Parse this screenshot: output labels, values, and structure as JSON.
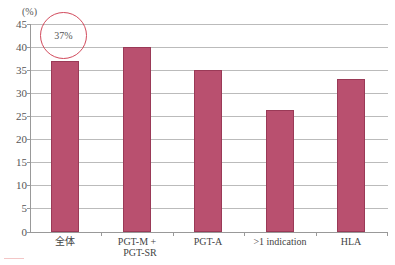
{
  "chart_data": {
    "type": "bar",
    "title": "",
    "xlabel": "",
    "ylabel": "(%)",
    "ylim": [
      0,
      45
    ],
    "yticks": [
      0,
      5,
      10,
      15,
      20,
      25,
      30,
      35,
      40,
      45
    ],
    "grid": true,
    "legend": null,
    "categories": [
      "全体",
      "PGT-M + PGT-SR",
      "PGT-A",
      ">1 indication",
      "HLA"
    ],
    "values": [
      37,
      40,
      35,
      26.5,
      33
    ],
    "bar_color": "#b9506f",
    "annotations": [
      {
        "text": "37%",
        "target": "全体",
        "shape": "circle",
        "color": "#d24a5c"
      }
    ]
  },
  "labels": {
    "unit": "(%)",
    "yticks": [
      "45",
      "40",
      "35",
      "30",
      "25",
      "20",
      "15",
      "10",
      "5",
      "0"
    ],
    "x": [
      "全体",
      "PGT-M +",
      "PGT-SR",
      "PGT-A",
      ">1 indication",
      "HLA"
    ],
    "annotation": "37%"
  }
}
